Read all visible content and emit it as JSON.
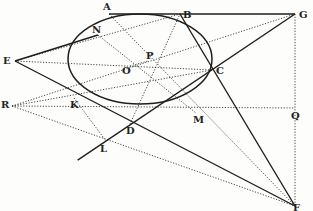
{
  "diagram": {
    "type": "geometry",
    "points": {
      "A": {
        "x": 109,
        "y": 14,
        "label": "A"
      },
      "B": {
        "x": 180,
        "y": 14,
        "label": "B"
      },
      "G": {
        "x": 295,
        "y": 14,
        "label": "G"
      },
      "E": {
        "x": 15,
        "y": 61,
        "label": "E"
      },
      "N": {
        "x": 98,
        "y": 35,
        "label": "N"
      },
      "O": {
        "x": 130,
        "y": 66,
        "label": "O"
      },
      "P": {
        "x": 148,
        "y": 61,
        "label": "P"
      },
      "C": {
        "x": 212,
        "y": 70,
        "label": "C"
      },
      "R": {
        "x": 12,
        "y": 106,
        "label": "R"
      },
      "K": {
        "x": 74,
        "y": 98,
        "label": "K"
      },
      "M": {
        "x": 196,
        "y": 113,
        "label": "M"
      },
      "Q": {
        "x": 295,
        "y": 108,
        "label": "Q"
      },
      "D": {
        "x": 130,
        "y": 124,
        "label": "D"
      },
      "L": {
        "x": 106,
        "y": 141,
        "label": "L"
      },
      "F": {
        "x": 295,
        "y": 206,
        "label": "F"
      }
    },
    "ellipse": {
      "cx": 140,
      "cy": 59,
      "rx": 72,
      "ry": 45,
      "rotation": 0
    },
    "solid_lines": [
      [
        "A",
        "G"
      ],
      [
        "E",
        "N"
      ],
      [
        "E",
        "F"
      ],
      [
        "G",
        "L"
      ],
      [
        "B",
        "F"
      ]
    ],
    "dotted_lines": [
      [
        "E",
        "C"
      ],
      [
        "E",
        "B"
      ],
      [
        "R",
        "C"
      ],
      [
        "R",
        "G"
      ],
      [
        "R",
        "F"
      ],
      [
        "R",
        "Q"
      ],
      [
        "N",
        "M"
      ],
      [
        "A",
        "F"
      ],
      [
        "G",
        "F"
      ],
      [
        "K",
        "L"
      ],
      [
        "D",
        "B"
      ],
      [
        "O",
        "P"
      ]
    ],
    "labels": [
      "A",
      "B",
      "G",
      "E",
      "N",
      "O",
      "P",
      "C",
      "R",
      "K",
      "M",
      "Q",
      "D",
      "L",
      "F"
    ]
  },
  "colors": {
    "ink": "#222222",
    "paper": "#fdfdfc"
  }
}
